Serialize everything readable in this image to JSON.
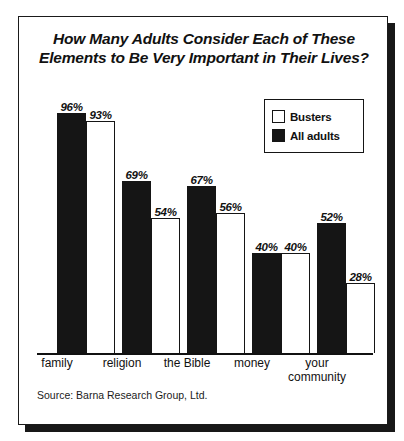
{
  "chart_data": {
    "type": "bar",
    "title": "How Many Adults Consider Each of These Elements to Be Very Important in Their Lives?",
    "xlabel": "",
    "ylabel": "",
    "ylim": [
      0,
      100
    ],
    "grid": false,
    "legend_position": "top-right",
    "value_suffix": "%",
    "categories": [
      "family",
      "religion",
      "the Bible",
      "money",
      "your\ncommunity"
    ],
    "series": [
      {
        "name": "All adults",
        "style": "dark",
        "values": [
          96,
          69,
          67,
          40,
          52
        ]
      },
      {
        "name": "Busters",
        "style": "light",
        "values": [
          93,
          54,
          56,
          40,
          28
        ]
      }
    ],
    "value_labels": {
      "family": [
        "96%",
        "93%"
      ],
      "religion": [
        "69%",
        "54%"
      ],
      "the Bible": [
        "67%",
        "56%"
      ],
      "money": [
        "40%",
        "40%"
      ],
      "community": [
        "52%",
        "28%"
      ]
    },
    "source": "Source: Barna Research Group, Ltd.",
    "colors": {
      "dark_bar": "#151515",
      "light_bar": "#ffffff",
      "outline": "#151515",
      "text": "#111111",
      "background": "#ffffff"
    }
  },
  "legend": {
    "items": [
      {
        "label": "Busters",
        "style": "light"
      },
      {
        "label": "All adults",
        "style": "dark"
      }
    ]
  }
}
